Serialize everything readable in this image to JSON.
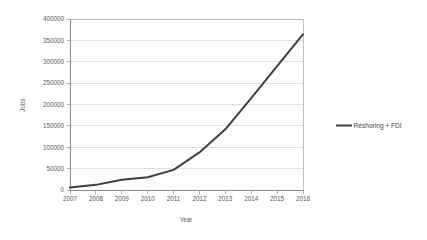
{
  "chart_data": {
    "type": "line",
    "title": "",
    "xlabel": "Year",
    "ylabel": "Jobs",
    "categories": [
      "2007",
      "2008",
      "2009",
      "2010",
      "2011",
      "2012",
      "2013",
      "2014",
      "2015",
      "2016"
    ],
    "x": [
      2007,
      2008,
      2009,
      2010,
      2011,
      2012,
      2013,
      2014,
      2015,
      2016
    ],
    "series": [
      {
        "name": "Reshoring + FDI",
        "color": "#3f3f3f",
        "values": [
          6000,
          12000,
          24000,
          30000,
          47000,
          88000,
          142000,
          215000,
          290000,
          364000
        ]
      }
    ],
    "ylim": [
      0,
      400000
    ],
    "yticks": [
      0,
      50000,
      100000,
      150000,
      200000,
      250000,
      300000,
      350000,
      400000
    ],
    "ytick_labels": [
      "0",
      "50000",
      "100000",
      "150000",
      "200000",
      "250000",
      "300000",
      "350000",
      "400000"
    ],
    "xtick_labels": [
      "2007",
      "2008",
      "2009",
      "2010",
      "2011",
      "2012",
      "2013",
      "2014",
      "2015",
      "2016"
    ],
    "grid": true,
    "grid_axis": "y",
    "legend_position": "right",
    "legend_entries": [
      "Reshoring + FDI"
    ],
    "markers": false,
    "background_color": "#ffffff",
    "gridline_color": "#c9c9c9",
    "axis_text_color": "#575757"
  },
  "axes": {
    "y_title": "Jobs",
    "x_title": "Year"
  },
  "legend": {
    "items": [
      {
        "label": "Reshoring + FDI",
        "color": "#3f3f3f"
      }
    ]
  }
}
